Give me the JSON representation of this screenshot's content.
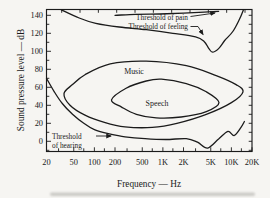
{
  "figure": {
    "ink": "#1b1b1b",
    "background": "#f6f5f2"
  },
  "chart_data": {
    "type": "line",
    "title": "",
    "xlabel": "Frequency — Hz",
    "ylabel": "Sound pressure level — dB",
    "x_scale": "log",
    "x_range_hz": [
      20,
      20000
    ],
    "y_range_db": [
      -12,
      146
    ],
    "grid": "off",
    "x_ticks": [
      {
        "f": 20,
        "label": "20"
      },
      {
        "f": 50,
        "label": "50"
      },
      {
        "f": 100,
        "label": "100"
      },
      {
        "f": 200,
        "label": "200"
      },
      {
        "f": 500,
        "label": "500"
      },
      {
        "f": 1000,
        "label": "1K"
      },
      {
        "f": 2000,
        "label": "2K"
      },
      {
        "f": 5000,
        "label": "5K"
      },
      {
        "f": 10000,
        "label": "10K"
      },
      {
        "f": 20000,
        "label": "20K"
      }
    ],
    "x_minor_ticks_hz": [
      30,
      70,
      140,
      300,
      700,
      1400,
      3000,
      7000,
      14000
    ],
    "y_ticks": [
      {
        "db": 0,
        "label": "0"
      },
      {
        "db": 20,
        "label": "20"
      },
      {
        "db": 40,
        "label": "40"
      },
      {
        "db": 60,
        "label": "60"
      },
      {
        "db": 80,
        "label": "80"
      },
      {
        "db": 100,
        "label": "100"
      },
      {
        "db": 120,
        "label": "120"
      },
      {
        "db": 140,
        "label": "140"
      }
    ],
    "y_minor_ticks_db": [
      -10,
      10,
      30,
      50,
      70,
      90,
      110,
      130
    ],
    "series": [
      {
        "name": "threshold-of-pain",
        "closed": false,
        "points_hz_db": [
          [
            200,
            140
          ],
          [
            400,
            141
          ],
          [
            900,
            141.5
          ],
          [
            2000,
            142.5
          ],
          [
            4000,
            143.5
          ],
          [
            6500,
            144.5
          ]
        ]
      },
      {
        "name": "threshold-of-feeling",
        "closed": false,
        "points_hz_db": [
          [
            33,
            146
          ],
          [
            60,
            137
          ],
          [
            105,
            131
          ],
          [
            230,
            127
          ],
          [
            570,
            124
          ],
          [
            1400,
            120
          ],
          [
            3000,
            116
          ],
          [
            4000,
            111
          ],
          [
            4700,
            103
          ],
          [
            5300,
            99
          ],
          [
            6500,
            103
          ],
          [
            8000,
            112
          ],
          [
            10500,
            122
          ],
          [
            13000,
            135
          ],
          [
            15000,
            146
          ]
        ]
      },
      {
        "name": "threshold-of-hearing",
        "closed": false,
        "points_hz_db": [
          [
            20,
            70
          ],
          [
            26,
            55
          ],
          [
            34,
            42
          ],
          [
            48,
            30
          ],
          [
            70,
            20
          ],
          [
            100,
            13
          ],
          [
            160,
            8.5
          ],
          [
            280,
            5
          ],
          [
            550,
            3
          ],
          [
            1100,
            2
          ],
          [
            2200,
            3
          ],
          [
            3200,
            -1
          ],
          [
            4500,
            -7.5
          ],
          [
            6500,
            2.5
          ],
          [
            8900,
            11
          ],
          [
            11000,
            6.5
          ],
          [
            13800,
            15.5
          ],
          [
            15500,
            22
          ]
        ]
      },
      {
        "name": "music-region",
        "closed": true,
        "points_hz_db": [
          [
            36,
            53
          ],
          [
            48,
            63
          ],
          [
            73,
            74
          ],
          [
            170,
            86
          ],
          [
            570,
            89
          ],
          [
            2200,
            84
          ],
          [
            6000,
            73
          ],
          [
            11700,
            63
          ],
          [
            14800,
            55
          ],
          [
            10000,
            43
          ],
          [
            4300,
            30
          ],
          [
            1600,
            20
          ],
          [
            700,
            15.5
          ],
          [
            280,
            16
          ],
          [
            140,
            21
          ],
          [
            73,
            29
          ],
          [
            44,
            40
          ]
        ]
      },
      {
        "name": "speech-region",
        "closed": true,
        "points_hz_db": [
          [
            178,
            46
          ],
          [
            290,
            59
          ],
          [
            570,
            67
          ],
          [
            950,
            69
          ],
          [
            2200,
            64
          ],
          [
            4300,
            55
          ],
          [
            6600,
            43
          ],
          [
            4300,
            33
          ],
          [
            1850,
            27
          ],
          [
            800,
            26
          ],
          [
            410,
            30
          ],
          [
            250,
            38
          ]
        ]
      }
    ],
    "annotations": [
      {
        "id": "pain-label",
        "text": "Threshold of pain",
        "pos": [
          188,
          19.5
        ],
        "anchor": "end",
        "class": "annot"
      },
      {
        "id": "feeling-label",
        "text": "Threshold of feeling",
        "pos": [
          188,
          29
        ],
        "anchor": "end",
        "class": "annot"
      },
      {
        "id": "hearing-label-line1",
        "text": "Threshold",
        "pos": [
          52,
          138.5
        ],
        "anchor": "start",
        "class": "annot"
      },
      {
        "id": "hearing-label-line2",
        "text": "of hearing",
        "pos": [
          52,
          148
        ],
        "anchor": "start",
        "class": "annot"
      },
      {
        "id": "music-label",
        "text": "Music",
        "pos": [
          134,
          73.5
        ],
        "anchor": "middle",
        "class": "region"
      },
      {
        "id": "speech-label",
        "text": "Speech",
        "pos": [
          157,
          105.5
        ],
        "anchor": "middle",
        "class": "region"
      }
    ],
    "arrows": [
      {
        "id": "pain-arrow",
        "points": [
          [
            190.5,
            16.5
          ],
          [
            215,
            13
          ]
        ]
      },
      {
        "id": "feeling-arrow",
        "points": [
          [
            190.5,
            26.5
          ],
          [
            198,
            26.5
          ],
          [
            203,
            34.5
          ]
        ]
      },
      {
        "id": "hearing-arrow",
        "points": [
          [
            96,
            136
          ],
          [
            111,
            136
          ]
        ]
      }
    ]
  }
}
